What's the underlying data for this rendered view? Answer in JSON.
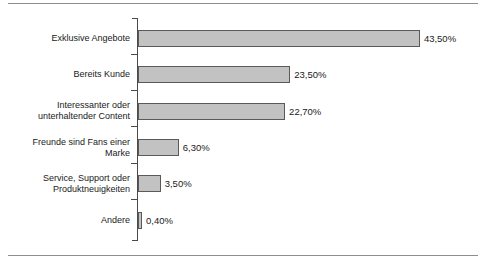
{
  "chart_data": {
    "type": "bar",
    "orientation": "horizontal",
    "title": "",
    "subtitle": "",
    "xlabel": "",
    "ylabel": "",
    "xlim": [
      0,
      43.5
    ],
    "grid": false,
    "legend": "none",
    "value_format": "german-decimal-percent",
    "categories": [
      "Exklusive Angebote",
      "Bereits Kunde",
      "Interessanter oder\nunterhaltender Content",
      "Freunde sind Fans einer\nMarke",
      "Service, Support oder\nProduktneuigkeiten",
      "Andere"
    ],
    "values": [
      43.5,
      23.5,
      22.7,
      6.3,
      3.5,
      0.4
    ],
    "value_labels": [
      "43,50%",
      "23,50%",
      "22,70%",
      "6,30%",
      "3,50%",
      "0,40%"
    ],
    "colors": {
      "bar_fill": "#c2c2c2",
      "bar_stroke": "#5a5a5a",
      "axis": "#4a4a4a",
      "text": "#1a1a1a",
      "rule": "#8e8e8e",
      "background": "#ffffff"
    }
  },
  "layout": {
    "axis_x_px": 138,
    "axis_top_px": 18,
    "axis_bottom_px": 240,
    "px_per_percent": 6.48,
    "bar_height_px": 17,
    "bar_tops_px": [
      30,
      66,
      103,
      139,
      175,
      212
    ],
    "tick_ys_px": [
      18,
      54,
      90,
      126,
      163,
      199,
      240
    ]
  }
}
